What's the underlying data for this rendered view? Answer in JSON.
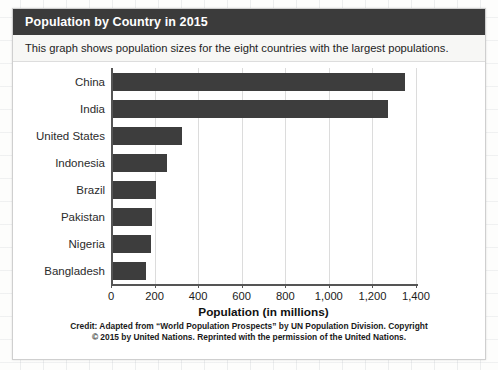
{
  "card": {
    "title": "Population by Country in 2015",
    "subtitle": "This graph shows population sizes for the eight countries with the largest populations."
  },
  "credit": {
    "kicker": "Credit:",
    "line1_rest": " Adapted from “World Population Prospects” by UN Population Division. Copyright",
    "line2": "© 2015 by United Nations. Reprinted with the permission of the United Nations."
  },
  "colors": {
    "header_bg": "#3b3b3b",
    "bar_fill": "#3d3d3d",
    "gridline": "#dcdcdc",
    "axis": "#555555"
  },
  "chart_data": {
    "type": "bar",
    "orientation": "horizontal",
    "title": "Population by Country in 2015",
    "xlabel": "Population (in millions)",
    "ylabel": "",
    "xlim": [
      0,
      1400
    ],
    "xticks": [
      0,
      200,
      400,
      600,
      800,
      1000,
      1200,
      1400
    ],
    "xtick_labels": [
      "0",
      "200",
      "400",
      "600",
      "800",
      "1,000",
      "1,200",
      "1,400"
    ],
    "grid": true,
    "legend": false,
    "categories": [
      "China",
      "India",
      "United States",
      "Indonesia",
      "Brazil",
      "Pakistan",
      "Nigeria",
      "Bangladesh"
    ],
    "values": [
      1350,
      1270,
      325,
      258,
      208,
      189,
      182,
      161
    ],
    "units": "millions"
  }
}
